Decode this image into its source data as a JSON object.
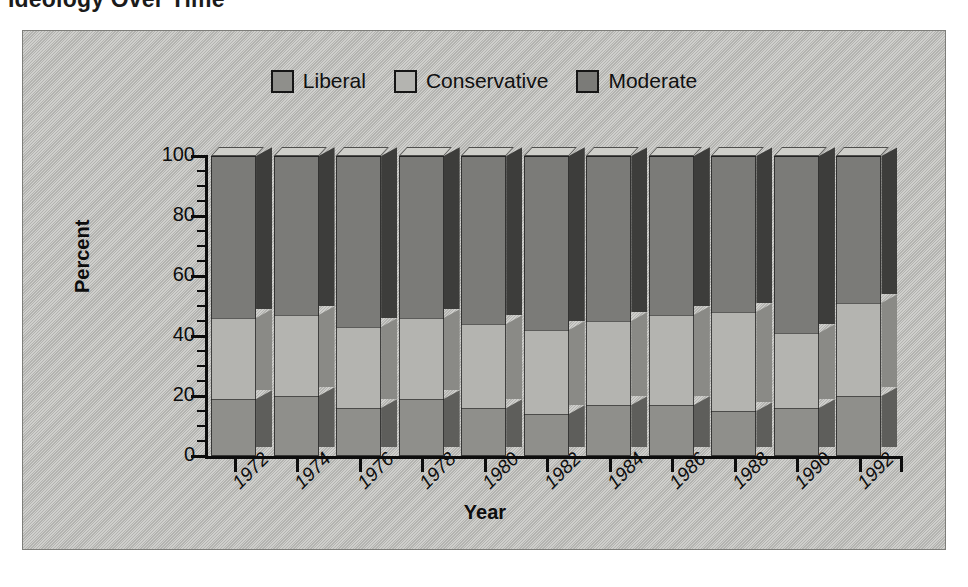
{
  "page": {
    "title": "Ideology Over Time"
  },
  "legend": {
    "position": "top-center",
    "entries": [
      {
        "label": "Liberal",
        "color": "#8f8f8b"
      },
      {
        "label": "Conservative",
        "color": "#b4b4b0"
      },
      {
        "label": "Moderate",
        "color": "#7b7b78"
      }
    ]
  },
  "axes": {
    "y_title": "Percent",
    "x_title": "Year",
    "y_ticks": [
      "0",
      "20",
      "40",
      "60",
      "80",
      "100"
    ],
    "y_minor_step": 5
  },
  "chart_data": {
    "type": "bar",
    "subtype": "stacked-100-percent-3d",
    "title": "Ideology Over Time",
    "xlabel": "Year",
    "ylabel": "Percent",
    "ylim": [
      0,
      100
    ],
    "grid": false,
    "legend_position": "top-center",
    "categories": [
      "1972",
      "1974",
      "1976",
      "1978",
      "1980",
      "1982",
      "1984",
      "1986",
      "1988",
      "1990",
      "1992"
    ],
    "series": [
      {
        "name": "Liberal",
        "color": "#8f8f8b",
        "values": [
          19,
          20,
          16,
          19,
          16,
          14,
          17,
          17,
          15,
          16,
          20
        ]
      },
      {
        "name": "Conservative",
        "color": "#b4b4b0",
        "values": [
          27,
          27,
          27,
          27,
          28,
          28,
          28,
          30,
          33,
          25,
          31
        ]
      },
      {
        "name": "Moderate",
        "color": "#7b7b78",
        "values": [
          54,
          53,
          57,
          54,
          56,
          58,
          55,
          53,
          52,
          59,
          49
        ]
      }
    ],
    "cumulative_tops": {
      "Liberal": [
        19,
        20,
        16,
        19,
        16,
        14,
        17,
        17,
        15,
        16,
        20
      ],
      "Conservative": [
        46,
        47,
        43,
        46,
        44,
        42,
        45,
        47,
        48,
        41,
        51
      ],
      "Moderate": [
        100,
        100,
        100,
        100,
        100,
        100,
        100,
        100,
        100,
        100,
        100
      ]
    }
  }
}
